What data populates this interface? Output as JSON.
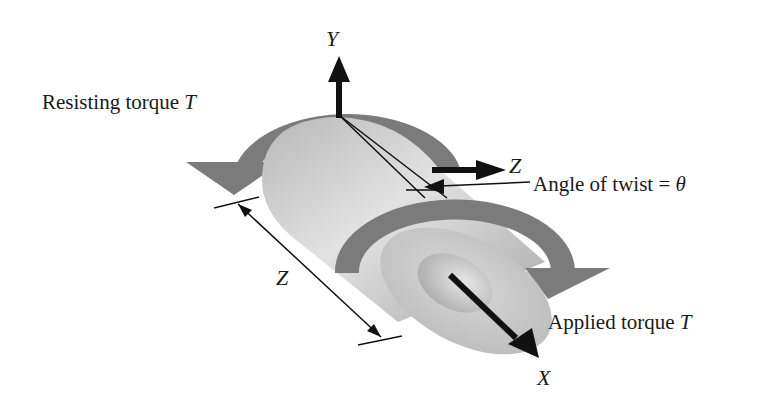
{
  "figure": {
    "type": "torsion-shaft-diagram",
    "labels": {
      "resisting_torque": "Resisting torque",
      "resisting_torque_symbol": "T",
      "applied_torque": "Applied torque",
      "applied_torque_symbol": "T",
      "angle_of_twist": "Angle of twist =",
      "angle_symbol": "θ",
      "length_symbol": "Z"
    },
    "axes": {
      "y": "Y",
      "z": "Z",
      "x": "X"
    },
    "colors": {
      "background": "#ffffff",
      "torque_arrow": "#7a7a7a",
      "shaft_light": "#e4e4e4",
      "shaft_dark": "#9a9a9a",
      "axis_arrow": "#111111"
    }
  }
}
